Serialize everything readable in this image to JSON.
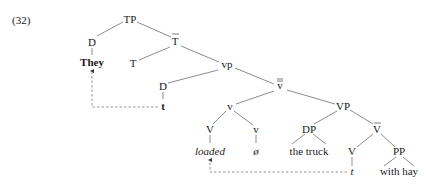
{
  "example_number": "(32)",
  "nodes": {
    "tp": "TP",
    "d_subject": "D",
    "they": "They",
    "t_bar": "T",
    "t_head": "T",
    "vp_little": "vp",
    "d_spec": "D",
    "trace_subject": "t",
    "v_double_bar": "v",
    "v_little_head": "v",
    "vp_big": "VP",
    "v_head_upper": "V",
    "v_little_lower": "v",
    "dp": "DP",
    "v_bar": "V",
    "loaded": "loaded",
    "null": "ø",
    "the_truck": "the truck",
    "v_head_lower": "V",
    "pp": "PP",
    "trace_verb": "t",
    "with_hay": "with hay"
  },
  "movement_arrows": [
    {
      "from": "t",
      "to": "They",
      "style": "dashed"
    },
    {
      "from": "t",
      "to": "loaded",
      "style": "dashed"
    }
  ]
}
